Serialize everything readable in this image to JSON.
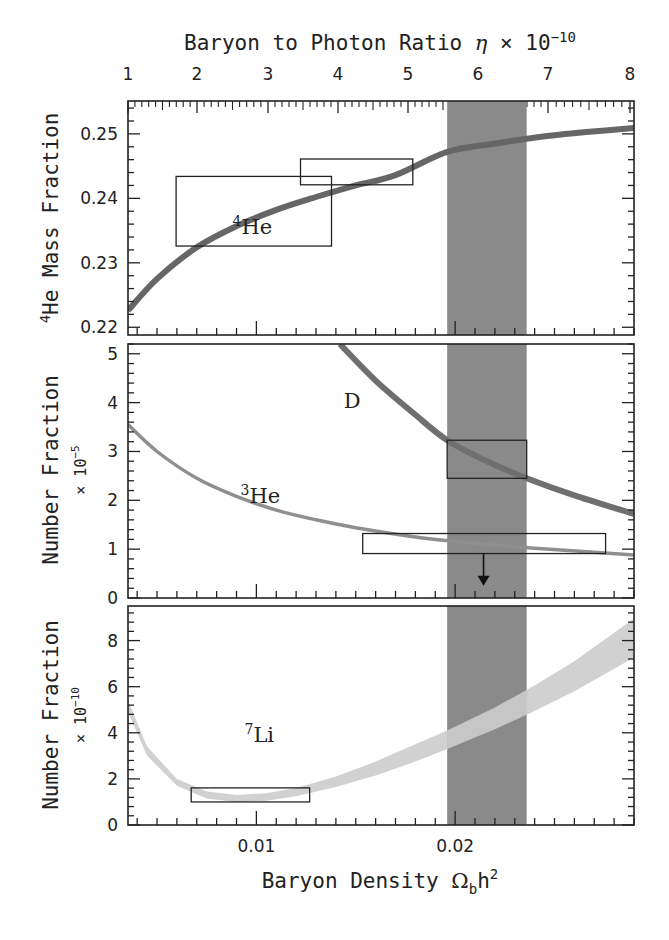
{
  "chart_data": {
    "type": "line",
    "xlabel": "Baryon Density Ω_b h²",
    "xlabel_parts": {
      "main": "Baryon Density ",
      "omega": "Ω",
      "sub": "b",
      "h": "h",
      "sup": "2"
    },
    "x_top_label": "Baryon to Photon Ratio η × 10⁻¹⁰",
    "x_top_label_parts": {
      "main": "Baryon to Photon Ratio ",
      "eta": "η",
      "times": " × 10",
      "sup": "−10"
    },
    "xlim": [
      0.00354,
      0.029
    ],
    "x_ticks": [
      0.01,
      0.02
    ],
    "x_tick_labels": [
      "0.01",
      "0.02"
    ],
    "x_top_ticks": [
      1,
      2,
      3,
      4,
      5,
      6,
      7,
      8
    ],
    "x_top_tick_px": [
      128,
      197,
      268,
      338,
      408,
      478,
      548,
      630
    ],
    "shaded_band": {
      "xmin": 0.0196,
      "xmax": 0.0236,
      "color": "#8a8a8a"
    },
    "panels": [
      {
        "name": "he4",
        "ylabel": "⁴He Mass Fraction",
        "ylabel_parts": {
          "sup": "4",
          "main": "He Mass Fraction"
        },
        "ylim": [
          0.2188,
          0.2551
        ],
        "y_ticks": [
          0.22,
          0.23,
          0.24,
          0.25
        ],
        "y_tick_labels": [
          "0.22",
          "0.23",
          "0.24",
          "0.25"
        ],
        "series": [
          {
            "name": "4He",
            "label_sup": "4",
            "label": "He",
            "color": "#666666",
            "width": 6,
            "x": [
              0.00354,
              0.005,
              0.007,
              0.009,
              0.011,
              0.013,
              0.015,
              0.017,
              0.0196,
              0.022,
              0.025,
              0.029
            ],
            "y": [
              0.2226,
              0.2275,
              0.2324,
              0.2357,
              0.2382,
              0.2402,
              0.242,
              0.2436,
              0.2472,
              0.2485,
              0.2498,
              0.2509
            ]
          }
        ],
        "boxes": [
          {
            "x0": 0.00596,
            "x1": 0.01378,
            "y0": 0.2326,
            "y1": 0.2434
          },
          {
            "x0": 0.01222,
            "x1": 0.01787,
            "y0": 0.2421,
            "y1": 0.2461
          }
        ],
        "annotation": {
          "sup": "4",
          "text": "He",
          "x": 0.0088,
          "y": 0.2345
        }
      },
      {
        "name": "d_he3",
        "ylabel": "Number Fraction",
        "yscale_label": {
          "pre": "× 10",
          "sup": "−5"
        },
        "ylim": [
          0,
          5.2
        ],
        "y_ticks": [
          0,
          1,
          2,
          3,
          4,
          5
        ],
        "y_tick_labels": [
          "0",
          "1",
          "2",
          "3",
          "4",
          "5"
        ],
        "series": [
          {
            "name": "D",
            "label": "D",
            "color": "#6f6f6f",
            "width": 6,
            "x": [
              0.0142,
              0.016,
              0.018,
              0.0196,
              0.0216,
              0.0236,
              0.026,
              0.029
            ],
            "y": [
              5.2,
              4.45,
              3.75,
              3.23,
              2.8,
              2.45,
              2.1,
              1.72
            ]
          },
          {
            "name": "3He",
            "label_sup": "3",
            "label": "He",
            "color": "#8f8f8f",
            "width": 3.5,
            "x": [
              0.00354,
              0.005,
              0.007,
              0.009,
              0.011,
              0.013,
              0.015,
              0.018,
              0.021,
              0.024,
              0.029
            ],
            "y": [
              3.55,
              3.0,
              2.45,
              2.08,
              1.8,
              1.6,
              1.44,
              1.25,
              1.12,
              1.02,
              0.88
            ]
          }
        ],
        "boxes": [
          {
            "x0": 0.0196,
            "x1": 0.0236,
            "y0": 2.45,
            "y1": 3.23
          },
          {
            "x0": 0.01535,
            "x1": 0.02757,
            "y0": 0.91,
            "y1": 1.32
          }
        ],
        "arrow": {
          "x": 0.02143,
          "y_from": 0.91,
          "y_to": 0.25
        },
        "annotations": [
          {
            "text": "D",
            "x": 0.0144,
            "y": 3.9
          },
          {
            "sup": "3",
            "text": "He",
            "x": 0.0092,
            "y": 1.95
          }
        ]
      },
      {
        "name": "li7",
        "ylabel": "Number Fraction",
        "yscale_label": {
          "pre": "× 10",
          "sup": "−10"
        },
        "ylim": [
          0,
          9.5
        ],
        "y_ticks": [
          0,
          2,
          4,
          6,
          8
        ],
        "y_tick_labels": [
          "0",
          "2",
          "4",
          "6",
          "8"
        ],
        "series": [
          {
            "name": "7Li",
            "label_sup": "7",
            "label": "Li",
            "color": "#cccccc",
            "band": true,
            "x": [
              0.00354,
              0.0045,
              0.006,
              0.0075,
              0.009,
              0.0105,
              0.012,
              0.014,
              0.016,
              0.018,
              0.0196,
              0.022,
              0.024,
              0.026,
              0.029
            ],
            "y_low": [
              4.9,
              3.0,
              1.7,
              1.15,
              1.0,
              1.05,
              1.25,
              1.65,
              2.15,
              2.75,
              3.3,
              4.15,
              4.95,
              5.8,
              7.26
            ],
            "y_high": [
              5.4,
              3.4,
              2.0,
              1.45,
              1.3,
              1.38,
              1.6,
              2.1,
              2.75,
              3.5,
              4.1,
              5.1,
              6.05,
              7.1,
              8.96
            ]
          }
        ],
        "boxes": [
          {
            "x0": 0.00672,
            "x1": 0.01268,
            "y0": 1.0,
            "y1": 1.61
          }
        ],
        "annotation": {
          "sup": "7",
          "text": "Li",
          "x": 0.0094,
          "y": 3.6
        }
      }
    ]
  }
}
